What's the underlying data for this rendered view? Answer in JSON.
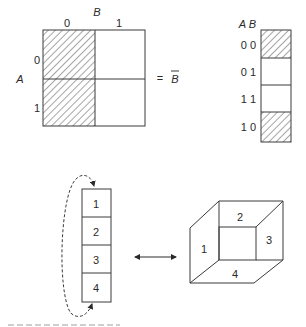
{
  "kmap": {
    "var_col": "B",
    "var_row": "A",
    "col_labels": [
      "0",
      "1"
    ],
    "row_labels": [
      "0",
      "1"
    ],
    "equals": "=",
    "result": "B",
    "result_overbar": true,
    "shaded_column": "0"
  },
  "strip": {
    "header": "A B",
    "rows": [
      {
        "label": "0 0",
        "shaded": true
      },
      {
        "label": "0 1",
        "shaded": false
      },
      {
        "label": "1 1",
        "shaded": false
      },
      {
        "label": "1 0",
        "shaded": true
      }
    ]
  },
  "column": {
    "cells": [
      "1",
      "2",
      "3",
      "4"
    ],
    "wraparound_arrow": "dashed, 4 back to 1"
  },
  "cube": {
    "faces": [
      "1",
      "2",
      "3",
      "4"
    ]
  },
  "link_arrow": "double-headed"
}
